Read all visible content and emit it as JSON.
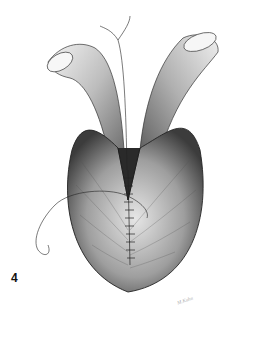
{
  "figure": {
    "label": "4",
    "signature": "M.Kuhn"
  },
  "colors": {
    "background": "#ffffff",
    "ink": "#222222",
    "shade_dark": "#555555",
    "shade_mid": "#999999",
    "shade_light": "#dddddd"
  }
}
